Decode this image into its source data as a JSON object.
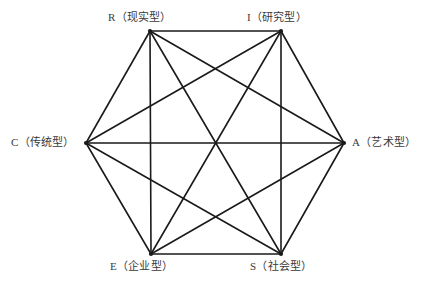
{
  "figure": {
    "shape": "hexagon",
    "background_color": "#ffffff",
    "line_color": "#1a1a1a",
    "text_color": "#3a3a3a",
    "edge_stroke_width": 1.6,
    "diagonal_stroke_width": 1.6
  },
  "vertices": [
    {
      "id": "R",
      "code": "R",
      "name": "（现实型）",
      "label": "R（现实型）",
      "x": 150,
      "y": 31,
      "position": "top-left"
    },
    {
      "id": "I",
      "code": "I",
      "name": "（研究型）",
      "label": "I（研究型）",
      "x": 281,
      "y": 31,
      "position": "top-right"
    },
    {
      "id": "A",
      "code": "A",
      "name": "（艺术型）",
      "label": "A（艺术型）",
      "x": 344,
      "y": 143,
      "position": "right"
    },
    {
      "id": "S",
      "code": "S",
      "name": "（社会型）",
      "label": "S（社会型）",
      "x": 281,
      "y": 254,
      "position": "bottom-right"
    },
    {
      "id": "E",
      "code": "E",
      "name": "（企业型）",
      "label": "E（企业型）",
      "x": 151,
      "y": 254,
      "position": "bottom-left"
    },
    {
      "id": "C",
      "code": "C",
      "name": "（传统型）",
      "label": "C（传统型）",
      "x": 86,
      "y": 143,
      "position": "left"
    }
  ],
  "edges": [
    {
      "from": "R",
      "to": "I",
      "kind": "perimeter"
    },
    {
      "from": "I",
      "to": "A",
      "kind": "perimeter"
    },
    {
      "from": "A",
      "to": "S",
      "kind": "perimeter"
    },
    {
      "from": "S",
      "to": "E",
      "kind": "perimeter"
    },
    {
      "from": "E",
      "to": "C",
      "kind": "perimeter"
    },
    {
      "from": "C",
      "to": "R",
      "kind": "perimeter"
    },
    {
      "from": "R",
      "to": "A",
      "kind": "short-diagonal"
    },
    {
      "from": "R",
      "to": "S",
      "kind": "long-diagonal"
    },
    {
      "from": "R",
      "to": "E",
      "kind": "short-diagonal"
    },
    {
      "from": "I",
      "to": "S",
      "kind": "short-diagonal"
    },
    {
      "from": "I",
      "to": "E",
      "kind": "long-diagonal"
    },
    {
      "from": "I",
      "to": "C",
      "kind": "short-diagonal"
    },
    {
      "from": "A",
      "to": "E",
      "kind": "short-diagonal"
    },
    {
      "from": "A",
      "to": "C",
      "kind": "long-diagonal"
    },
    {
      "from": "S",
      "to": "C",
      "kind": "short-diagonal"
    }
  ],
  "center": {
    "x": 215,
    "y": 143
  }
}
